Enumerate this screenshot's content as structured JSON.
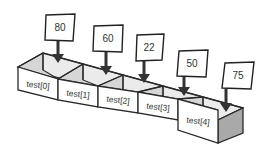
{
  "diagram": {
    "array_name": "test",
    "elements": [
      {
        "index": 0,
        "label": "test[0]",
        "value": "80"
      },
      {
        "index": 1,
        "label": "test[1]",
        "value": "60"
      },
      {
        "index": 2,
        "label": "test[2]",
        "value": "22"
      },
      {
        "index": 3,
        "label": "test[3]",
        "value": "50"
      },
      {
        "index": 4,
        "label": "test[4]",
        "value": "75"
      }
    ],
    "colors": {
      "outline": "#2a2a2a",
      "front_face": "#ffffff",
      "inner_face": "#d6d6d6",
      "side_face": "#a9a9a9",
      "arrow": "#333333"
    }
  }
}
